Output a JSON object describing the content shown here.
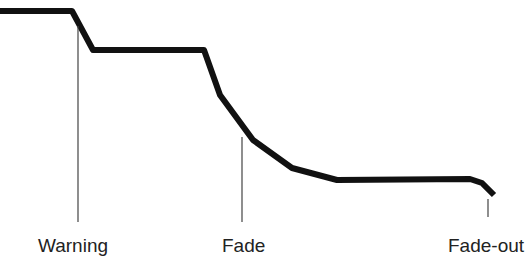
{
  "diagram": {
    "curve": {
      "color": "#111111",
      "points": [
        [
          0,
          11
        ],
        [
          72,
          11
        ],
        [
          93,
          50
        ],
        [
          204,
          50
        ],
        [
          220,
          95
        ],
        [
          253,
          140
        ],
        [
          292,
          168
        ],
        [
          337,
          180
        ],
        [
          470,
          179
        ],
        [
          482,
          183
        ],
        [
          494,
          195
        ]
      ]
    },
    "markers": [
      {
        "label": "Warning",
        "x": 78,
        "y1": 26,
        "y2": 222,
        "label_x": 38,
        "label_y": 236
      },
      {
        "label": "Fade",
        "x": 242,
        "y1": 137,
        "y2": 222,
        "label_x": 222,
        "label_y": 236
      },
      {
        "label": "Fade-out",
        "x": 488,
        "y1": 199,
        "y2": 217,
        "label_x": 448,
        "label_y": 236
      }
    ]
  }
}
